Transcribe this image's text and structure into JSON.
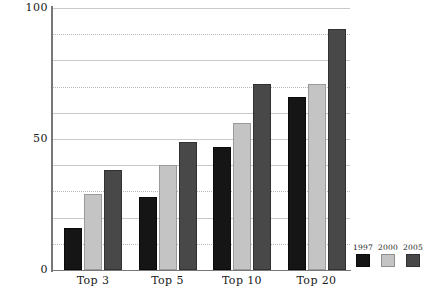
{
  "chart_data": {
    "type": "bar",
    "title": "",
    "subtitle": "",
    "xlabel": "",
    "ylabel": "",
    "categories": [
      "Top 3",
      "Top 5",
      "Top 10",
      "Top 20"
    ],
    "series": [
      {
        "name": "1997",
        "color": "#151515",
        "values": [
          16,
          28,
          47,
          66
        ]
      },
      {
        "name": "2000",
        "color": "#c4c4c4",
        "values": [
          29,
          40,
          56,
          71
        ]
      },
      {
        "name": "2005",
        "color": "#484848",
        "values": [
          38,
          49,
          71,
          92
        ]
      }
    ],
    "ylim": [
      0,
      100
    ],
    "ytick_labels": [
      "0",
      "50",
      "100"
    ],
    "ytick_values": [
      0,
      50,
      100
    ],
    "gridline_values": [
      0,
      10,
      20,
      30,
      40,
      50,
      60,
      70,
      80,
      90,
      100
    ],
    "grid": true,
    "legend_position": "bottom-right",
    "orientation": "vertical",
    "grouping": "grouped"
  },
  "axes": {
    "y_labels": [
      {
        "text": "100",
        "value": 100
      },
      {
        "text": "50",
        "value": 50
      },
      {
        "text": "0",
        "value": 0
      }
    ],
    "x_labels": [
      "Top 3",
      "Top 5",
      "Top 10",
      "Top 20"
    ]
  },
  "legend": {
    "entries": [
      {
        "label": "1997",
        "swatch": "legend-swatch-1997"
      },
      {
        "label": "2000",
        "swatch": "legend-swatch-2000"
      },
      {
        "label": "2005",
        "swatch": "legend-swatch-2005"
      }
    ]
  },
  "caption": {
    "text": ""
  }
}
